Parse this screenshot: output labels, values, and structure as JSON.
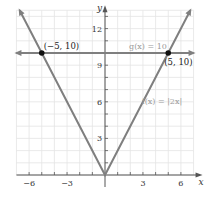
{
  "chart_data": {
    "type": "line",
    "title": "",
    "xlabel": "x",
    "ylabel": "y",
    "xlim": [
      -7,
      7
    ],
    "ylim": [
      0,
      13.5
    ],
    "grid": true,
    "x_ticks": [
      -6,
      -3,
      3,
      6
    ],
    "x_tick_labels": [
      "−6",
      "−3",
      "3",
      "6"
    ],
    "y_ticks": [
      3,
      6,
      9,
      12
    ],
    "y_tick_labels": [
      "3",
      "6",
      "9",
      "12"
    ],
    "series": [
      {
        "name": "f(x) = |2x|",
        "label": "f(x) = |2x|",
        "x": [
          -6.75,
          0,
          6.75
        ],
        "y": [
          13.5,
          0,
          13.5
        ],
        "color": "#7f7f7f"
      },
      {
        "name": "g(x) = 10",
        "label": "g(x) = 10",
        "x": [
          -7,
          7
        ],
        "y": [
          10,
          10
        ],
        "color": "#7f7f7f"
      }
    ],
    "points": [
      {
        "x": -5,
        "y": 10,
        "label": "(−5, 10)"
      },
      {
        "x": 5,
        "y": 10,
        "label": "(5, 10)"
      }
    ],
    "colors": {
      "grid": "#e4e4e4",
      "axis": "#555555",
      "curve": "#7f7f7f",
      "point": "#111111",
      "fn_label": "#9a9a9a"
    }
  }
}
